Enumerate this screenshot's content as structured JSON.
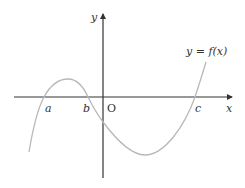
{
  "figure": {
    "axes": {
      "x_label": "x",
      "y_label": "y",
      "origin_label": "O"
    },
    "curve_label": "y = f(x)",
    "roots": [
      {
        "name": "a",
        "label": "a"
      },
      {
        "name": "b",
        "label": "b"
      },
      {
        "name": "c",
        "label": "c"
      }
    ],
    "colors": {
      "axis": "#333333",
      "curve": "#b8b8b8",
      "text": "#333333"
    }
  }
}
